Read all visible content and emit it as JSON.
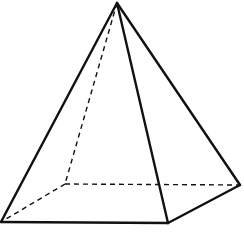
{
  "diagram": {
    "type": "square-pyramid",
    "title": "",
    "stroke_color": "#111111",
    "background": "#ffffff",
    "vertices": {
      "apex": [
        117,
        3
      ],
      "front_left": [
        1,
        222
      ],
      "front_right": [
        168,
        223
      ],
      "back_right": [
        240,
        185
      ],
      "back_left": [
        65,
        184
      ]
    },
    "solid_edges": [
      [
        "apex",
        "front_left"
      ],
      [
        "apex",
        "front_right"
      ],
      [
        "apex",
        "back_right"
      ],
      [
        "front_left",
        "front_right"
      ],
      [
        "front_right",
        "back_right"
      ]
    ],
    "hidden_edges": [
      [
        "apex",
        "back_left"
      ],
      [
        "back_left",
        "front_left"
      ],
      [
        "back_left",
        "back_right"
      ]
    ]
  }
}
